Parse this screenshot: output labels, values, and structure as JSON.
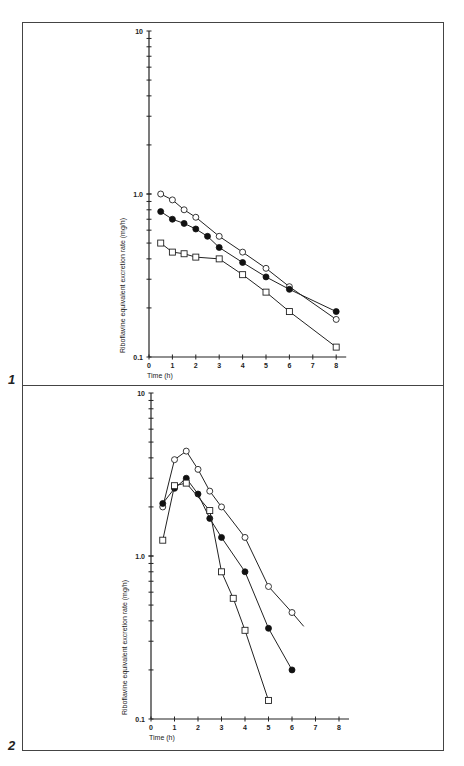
{
  "figures": [
    {
      "number": "1"
    },
    {
      "number": "2"
    }
  ],
  "chart_data": [
    {
      "type": "line",
      "title": "",
      "figure": "1",
      "xlabel": "Time (h)",
      "ylabel": "Riboflavine equivalent excretion rate (mg/h)",
      "yscale": "log",
      "xlim": [
        0,
        8
      ],
      "ylim": [
        0.1,
        10
      ],
      "xticks": [
        0,
        1,
        2,
        3,
        4,
        5,
        6,
        7,
        8
      ],
      "yticks": [
        "0.1",
        "1.0",
        "10"
      ],
      "grid": false,
      "legend": null,
      "series": [
        {
          "name": "open-circle",
          "marker": "open-circle",
          "x": [
            0.5,
            1,
            1.5,
            2,
            3,
            4,
            5,
            6,
            8
          ],
          "y": [
            1.0,
            0.92,
            0.8,
            0.72,
            0.55,
            0.44,
            0.35,
            0.27,
            0.17
          ]
        },
        {
          "name": "filled-circle",
          "marker": "filled-circle",
          "x": [
            0.5,
            1,
            1.5,
            2,
            2.5,
            3,
            4,
            5,
            6,
            8
          ],
          "y": [
            0.78,
            0.7,
            0.66,
            0.61,
            0.55,
            0.47,
            0.38,
            0.31,
            0.26,
            0.19
          ]
        },
        {
          "name": "open-square",
          "marker": "open-square",
          "x": [
            0.5,
            1,
            1.5,
            2,
            3,
            4,
            5,
            6,
            8
          ],
          "y": [
            0.5,
            0.44,
            0.43,
            0.41,
            0.4,
            0.32,
            0.25,
            0.19,
            0.115
          ]
        }
      ]
    },
    {
      "type": "line",
      "title": "",
      "figure": "2",
      "xlabel": "Time (h)",
      "ylabel": "Riboflavine equivalent excretion rate (mg/h)",
      "yscale": "log",
      "xlim": [
        0,
        8
      ],
      "ylim": [
        0.1,
        10
      ],
      "xticks": [
        0,
        1,
        2,
        3,
        4,
        5,
        6,
        7,
        8
      ],
      "yticks": [
        "0.1",
        "1.0",
        "10"
      ],
      "grid": false,
      "legend": null,
      "series": [
        {
          "name": "open-circle",
          "marker": "open-circle",
          "x": [
            0.5,
            1,
            1.5,
            2,
            2.5,
            3,
            4,
            5,
            6
          ],
          "y": [
            2.0,
            3.9,
            4.4,
            3.4,
            2.5,
            2.0,
            1.3,
            0.65,
            0.45
          ],
          "fit_line_end": [
            6.5,
            0.37
          ]
        },
        {
          "name": "filled-circle",
          "marker": "filled-circle",
          "x": [
            0.5,
            1,
            1.5,
            2,
            2.5,
            3,
            4,
            5,
            6
          ],
          "y": [
            2.1,
            2.6,
            3.0,
            2.4,
            1.7,
            1.3,
            0.8,
            0.36,
            0.2
          ]
        },
        {
          "name": "open-square",
          "marker": "open-square",
          "x": [
            0.5,
            1,
            1.5,
            2.5,
            3,
            3.5,
            4,
            5
          ],
          "y": [
            1.25,
            2.7,
            2.8,
            1.9,
            0.8,
            0.55,
            0.35,
            0.13
          ]
        }
      ]
    }
  ]
}
